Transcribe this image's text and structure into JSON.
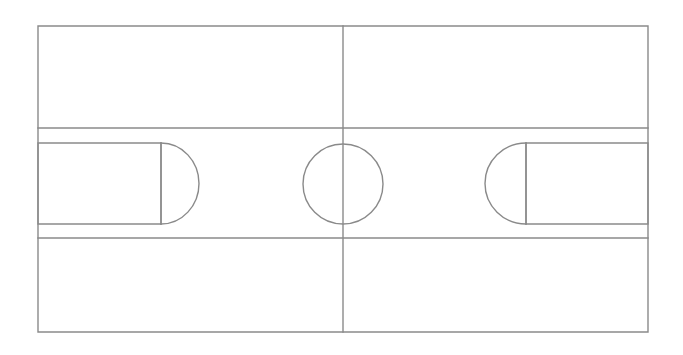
{
  "figure": {
    "title": "Basketball court line diagram",
    "canvas_width": 683,
    "canvas_height": 355,
    "background_color": "#ffffff",
    "line_color": "#8a8a8a",
    "line_width": 1.4
  },
  "geometry": {
    "court_outline": {
      "name": "court-boundary",
      "x": 38,
      "y": 26,
      "width": 610,
      "height": 306
    },
    "sideline_top": {
      "name": "upper-lane-line",
      "x1": 38,
      "y1": 128,
      "x2": 648,
      "y2": 128
    },
    "sideline_bottom": {
      "name": "lower-lane-line",
      "x1": 38,
      "y1": 238,
      "x2": 648,
      "y2": 238
    },
    "halfway_line": {
      "name": "halfway-line",
      "x1": 343,
      "y1": 26,
      "x2": 343,
      "y2": 332
    },
    "center_circle": {
      "name": "center-circle",
      "cx": 343,
      "cy": 184,
      "r": 40
    },
    "left_key": {
      "name": "left-key",
      "x": 38,
      "y": 143,
      "width": 123,
      "height": 81
    },
    "left_free_throw_line": {
      "name": "left-free-throw-line",
      "x1": 161,
      "y1": 143,
      "x2": 161,
      "y2": 224
    },
    "left_free_throw_arc": {
      "name": "left-free-throw-arc",
      "cx": 161,
      "cy": 183.5,
      "rx": 38,
      "ry": 40.5,
      "direction": "right"
    },
    "right_key": {
      "name": "right-key",
      "x": 526,
      "y": 143,
      "width": 122,
      "height": 81
    },
    "right_free_throw_line": {
      "name": "right-free-throw-line",
      "x1": 526,
      "y1": 143,
      "x2": 526,
      "y2": 224
    },
    "right_free_throw_arc": {
      "name": "right-free-throw-arc",
      "cx": 526,
      "cy": 183.5,
      "rx": 41,
      "ry": 40.5,
      "direction": "left"
    }
  },
  "chart_data": {
    "type": "diagram",
    "title": "Basketball court line diagram",
    "elements": [
      {
        "label": "Court boundary",
        "shape": "rectangle",
        "x": 38,
        "y": 26,
        "width": 610,
        "height": 306
      },
      {
        "label": "Upper lane line",
        "shape": "line",
        "x1": 38,
        "y1": 128,
        "x2": 648,
        "y2": 128
      },
      {
        "label": "Lower lane line",
        "shape": "line",
        "x1": 38,
        "y1": 238,
        "x2": 648,
        "y2": 238
      },
      {
        "label": "Halfway line",
        "shape": "line",
        "x1": 343,
        "y1": 26,
        "x2": 343,
        "y2": 332
      },
      {
        "label": "Center circle",
        "shape": "circle",
        "cx": 343,
        "cy": 184,
        "r": 40
      },
      {
        "label": "Left key",
        "shape": "rectangle",
        "x": 38,
        "y": 143,
        "width": 123,
        "height": 81
      },
      {
        "label": "Left free-throw line",
        "shape": "line",
        "x1": 161,
        "y1": 143,
        "x2": 161,
        "y2": 224
      },
      {
        "label": "Left free-throw arc",
        "shape": "arc",
        "cx": 161,
        "cy": 184,
        "rx": 38,
        "ry": 41
      },
      {
        "label": "Right key",
        "shape": "rectangle",
        "x": 526,
        "y": 143,
        "width": 122,
        "height": 81
      },
      {
        "label": "Right free-throw line",
        "shape": "line",
        "x1": 526,
        "y1": 143,
        "x2": 526,
        "y2": 224
      },
      {
        "label": "Right free-throw arc",
        "shape": "arc",
        "cx": 526,
        "cy": 184,
        "rx": 41,
        "ry": 41
      }
    ],
    "grid": false,
    "legend": null,
    "xlabel": "",
    "ylabel": ""
  }
}
